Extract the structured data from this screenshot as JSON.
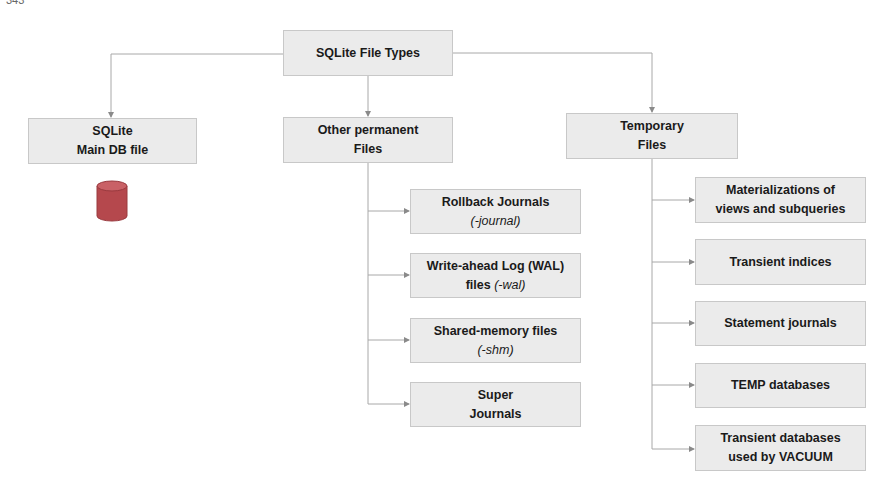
{
  "page_number": "343",
  "diagram": {
    "root": {
      "line1": "SQLite File Types"
    },
    "main_db": {
      "line1": "SQLite",
      "line2": "Main DB file",
      "icon": "database-cylinder-icon",
      "icon_color": "#b5484d"
    },
    "permanent": {
      "line1": "Other permanent",
      "line2": "Files",
      "children": [
        {
          "line1": "Rollback Journals",
          "sub": "(-journal)"
        },
        {
          "line1": "Write-ahead Log (WAL)",
          "line2_plain": "files ",
          "sub": "(-wal)"
        },
        {
          "line1": "Shared-memory files",
          "sub": "(-shm)"
        },
        {
          "line1": "Super",
          "line2": "Journals"
        }
      ]
    },
    "temporary": {
      "line1": "Temporary",
      "line2": "Files",
      "children": [
        {
          "line1": "Materializations of",
          "line2": "views and subqueries"
        },
        {
          "line1": "Transient indices"
        },
        {
          "line1": "Statement journals"
        },
        {
          "line1": "TEMP databases"
        },
        {
          "line1": "Transient databases",
          "line2": "used by VACUUM"
        }
      ]
    },
    "colors": {
      "box_fill": "#ebebeb",
      "box_border": "#c8c8c8",
      "connector": "#a8a8a8"
    }
  }
}
